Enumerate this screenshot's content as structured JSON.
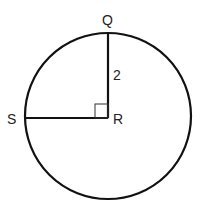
{
  "diagram": {
    "type": "circle-with-radii",
    "center": {
      "label": "R",
      "x": 108,
      "y": 118
    },
    "radius_px": 84,
    "points": [
      {
        "label": "Q",
        "x": 108,
        "y": 34
      },
      {
        "label": "S",
        "x": 24,
        "y": 118
      }
    ],
    "segments": [
      {
        "from": "R",
        "to": "Q",
        "length_label": "2"
      },
      {
        "from": "R",
        "to": "S",
        "length_label": ""
      }
    ],
    "right_angle_at": "R",
    "labels": {
      "q": "Q",
      "r": "R",
      "s": "S",
      "rq_length": "2"
    },
    "stroke_color": "#111111"
  }
}
